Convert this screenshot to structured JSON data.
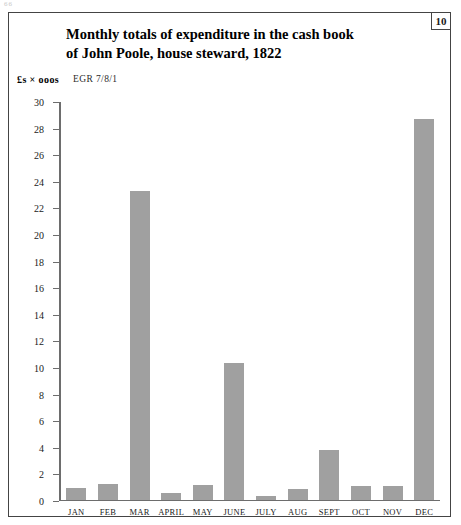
{
  "page": {
    "artifact_text": "66"
  },
  "plate": {
    "number": "10"
  },
  "figure": {
    "title_line1": "Monthly totals of expenditure in the cash book",
    "title_line2": "of John Poole, house steward, 1822",
    "units_label": "£s × ooos",
    "source_reference": "EGR 7/8/1"
  },
  "chart_data": {
    "type": "bar",
    "title": "Monthly totals of expenditure in the cash book of John Poole, house steward, 1822",
    "xlabel": "",
    "ylabel": "£s × ooos",
    "ylim": [
      0,
      30
    ],
    "ytick_step": 2,
    "yticks": [
      30,
      28,
      26,
      24,
      22,
      20,
      18,
      16,
      14,
      12,
      10,
      8,
      6,
      4,
      2,
      0
    ],
    "grid": false,
    "legend": null,
    "bar_color": "#a0a0a0",
    "axis_color": "#6d6d6d",
    "categories": [
      "JAN",
      "FEB",
      "MAR",
      "APRIL",
      "MAY",
      "JUNE",
      "JULY",
      "AUG",
      "SEPT",
      "OCT",
      "NOV",
      "DEC"
    ],
    "values": [
      0.85,
      1.2,
      23.2,
      0.5,
      1.1,
      10.25,
      0.25,
      0.8,
      3.7,
      1.0,
      1.0,
      28.6
    ]
  }
}
